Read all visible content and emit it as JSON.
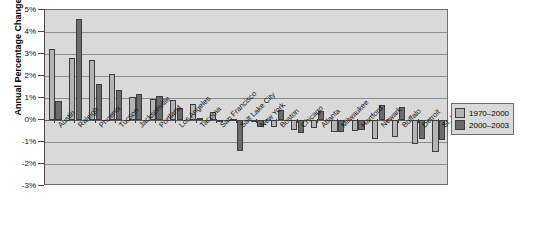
{
  "chart_data": {
    "type": "bar",
    "title": "",
    "xlabel": "",
    "ylabel": "Annual Percentage Change",
    "ylim": [
      -3,
      5
    ],
    "ytick_labels": [
      "5%",
      "4%",
      "3%",
      "2%",
      "1%",
      "0%",
      "-1%",
      "-2%",
      "-3%"
    ],
    "ytick_values": [
      5,
      4,
      3,
      2,
      1,
      0,
      -1,
      -2,
      -3
    ],
    "grid": true,
    "legend_position": "right",
    "categories": [
      "Austin",
      "Raleigh",
      "Phoenix",
      "Tucson",
      "Jacksonville",
      "Portland",
      "Los Angeles",
      "Tacoma",
      "San Francisco",
      "Salt Lake City",
      "New York",
      "Boston",
      "Chicago",
      "Atlanta",
      "Milwaukee",
      "Hartford",
      "Newark",
      "Buffalo",
      "Detroit",
      "St. Louis"
    ],
    "series": [
      {
        "name": "1970–2000",
        "color": "#b4b4b4",
        "values": [
          3.25,
          2.8,
          2.75,
          2.1,
          1.05,
          0.95,
          0.9,
          0.75,
          0.35,
          0.05,
          -0.1,
          -0.3,
          -0.45,
          -0.35,
          -0.55,
          -0.5,
          -0.85,
          -0.75,
          -1.1,
          -1.45
        ]
      },
      {
        "name": "2000–2003",
        "color": "#6b6b6b",
        "values": [
          0.85,
          4.6,
          1.65,
          1.35,
          1.2,
          1.1,
          0.55,
          0.1,
          0.0,
          -1.4,
          -0.3,
          0.45,
          -0.6,
          0.4,
          -0.55,
          -0.45,
          0.7,
          0.6,
          -0.85,
          -0.9
        ]
      }
    ]
  },
  "legend": {
    "items": [
      {
        "label": "1970–2000"
      },
      {
        "label": "2000–2003"
      }
    ]
  },
  "axis": {
    "y_title": "Annual Percentage Change"
  }
}
